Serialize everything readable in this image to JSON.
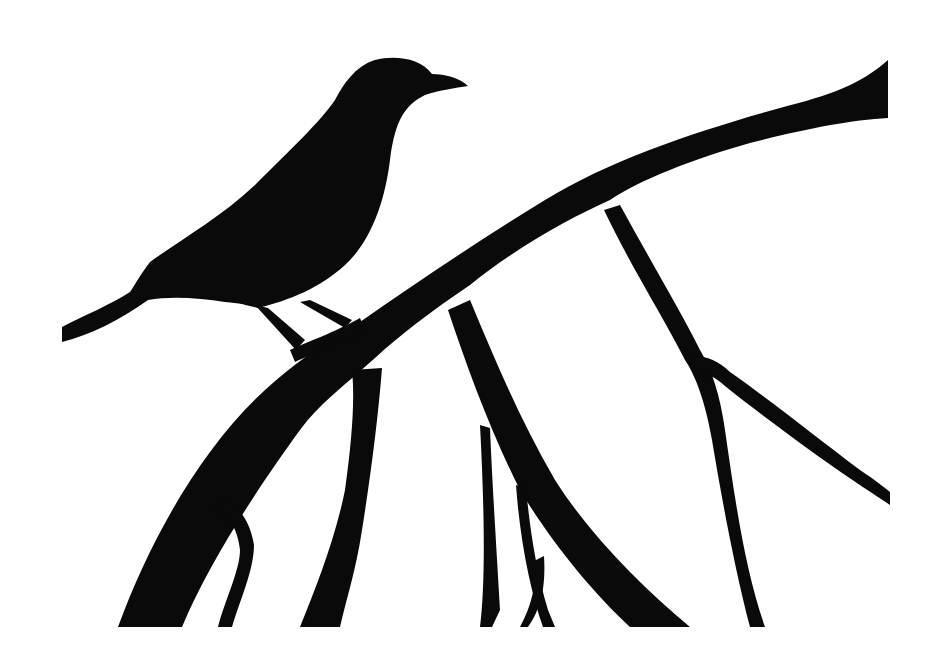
{
  "image": {
    "description": "Black silhouette of a bird perched on a curved tree branch with hanging twigs on a white background",
    "subject": "bird silhouette on branch",
    "colors": {
      "background": "#ffffff",
      "silhouette": "#0a0a0a"
    }
  }
}
